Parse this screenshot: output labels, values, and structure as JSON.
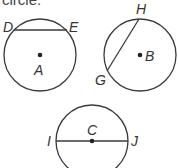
{
  "caption": "circle.",
  "stroke_color": "#3a3a3a",
  "circles": [
    {
      "name": "A",
      "center_label": "A",
      "chord": {
        "type": "chord",
        "endpoints": [
          "D",
          "E"
        ]
      }
    },
    {
      "name": "B",
      "center_label": "B",
      "chord": {
        "type": "chord",
        "endpoints": [
          "G",
          "H"
        ]
      }
    },
    {
      "name": "C",
      "center_label": "C",
      "chord": {
        "type": "diameter",
        "endpoints": [
          "I",
          "J"
        ]
      }
    }
  ],
  "labels": {
    "D": "D",
    "E": "E",
    "A": "A",
    "H": "H",
    "G": "G",
    "B": "B",
    "C": "C",
    "I": "I",
    "J": "J"
  }
}
